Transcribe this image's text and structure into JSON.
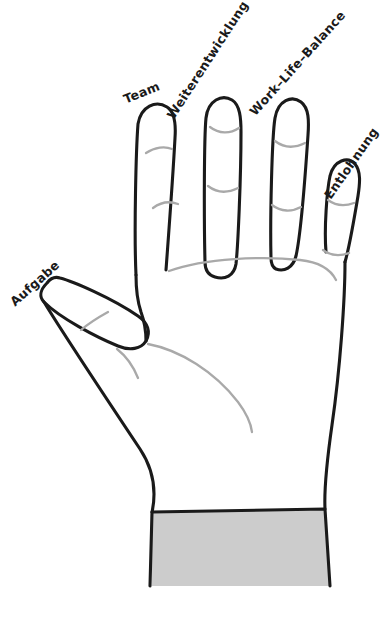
{
  "diagram": {
    "type": "hand-sketch",
    "style": "hand-drawn line sketch",
    "colors": {
      "background": "#ffffff",
      "outline": "#1a1a1a",
      "crease": "#a9a9a9",
      "sleeve_fill": "#cccccc",
      "label_text": "#1a1a1a"
    },
    "labels": [
      {
        "id": "aufgabe",
        "text": "Aufgabe",
        "finger": "thumb"
      },
      {
        "id": "team",
        "text": "Team",
        "finger": "index"
      },
      {
        "id": "weiterentwicklung",
        "text": "Weiterentwicklung",
        "finger": "middle"
      },
      {
        "id": "worklifebalance",
        "text": "Work–Life–Balance",
        "finger": "ring"
      },
      {
        "id": "entlohnung",
        "text": "Entlohnung",
        "finger": "little"
      }
    ]
  }
}
